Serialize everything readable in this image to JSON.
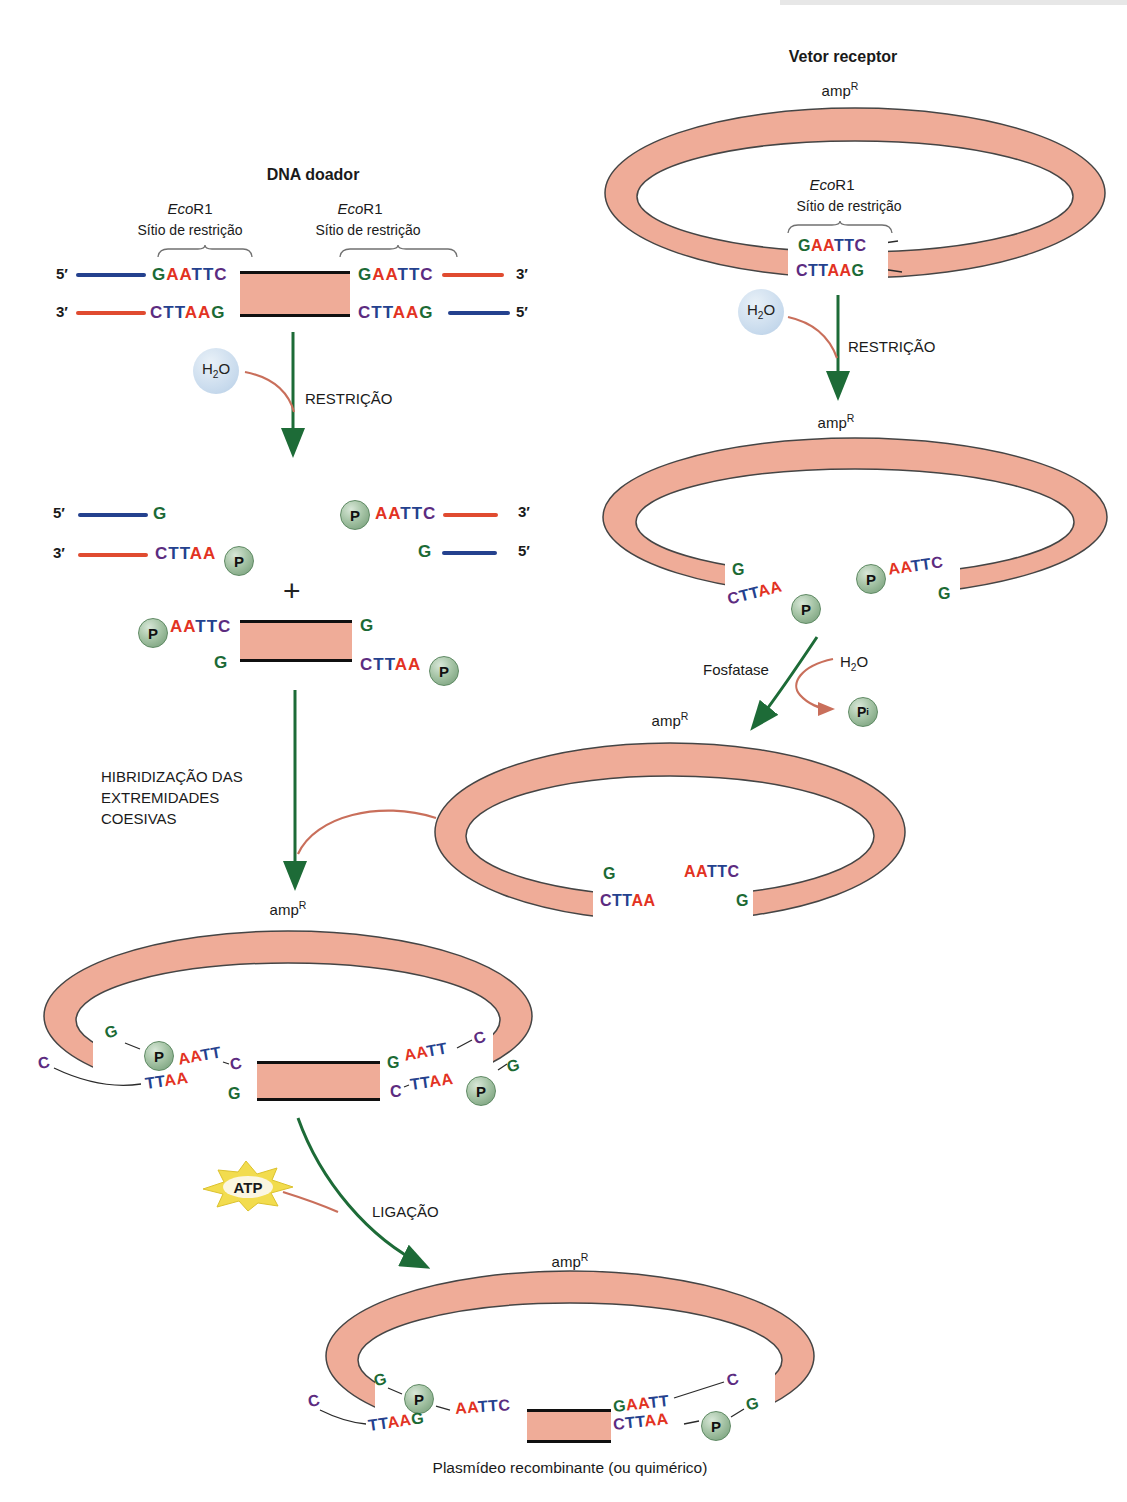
{
  "colors": {
    "nt_g": "#1b6a35",
    "nt_a": "#e23222",
    "nt_t": "#24418e",
    "nt_c": "#5c2b80",
    "strand_blue": "#24418e",
    "strand_red": "#e04b30",
    "ring_fill": "#efac98",
    "arrow_green": "#1d6b37",
    "arrow_salmon": "#c96f5b",
    "p_circle_green": "#8fb48f",
    "h2o_blue": "#c8daeb",
    "atp_yellow": "#f2dc4e"
  },
  "titles": {
    "donor": "DNA doador",
    "vector": "Vetor receptor",
    "caption": "Plasmídeo recombinante (ou quimérico)"
  },
  "enzyme": {
    "italic": "Eco",
    "rest": "R1",
    "site": "Sítio de restrição"
  },
  "steps": {
    "restriction": "RESTRIÇÃO",
    "hybridization_l1": "HIBRIDIZAÇÃO DAS",
    "hybridization_l2": "EXTREMIDADES",
    "hybridization_l3": "COESIVAS",
    "phosphatase": "Fosfatase",
    "ligation": "LIGAÇÃO"
  },
  "molecules": {
    "amp": "amp",
    "amp_sup": "R",
    "h": "H",
    "two": "2",
    "o": "O",
    "atp": "ATP",
    "p": "P",
    "i": "i",
    "plus": "+"
  },
  "strand_labels": {
    "five": "5′",
    "three": "3′"
  },
  "seq": {
    "gaattc": "GAATTC",
    "cttaag": "CTTAAG",
    "cttaa": "CTTAA",
    "aattc": "AATTC",
    "aatt": "AATT",
    "ttaa": "TTAA",
    "ttaag": "TTAAG",
    "gaatt": "GAATT",
    "g": "G",
    "c": "C"
  }
}
